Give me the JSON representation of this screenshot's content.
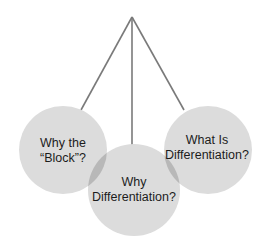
{
  "diagram": {
    "apex": {
      "x": 132,
      "y": 17
    },
    "colors": {
      "circle_fill": "#dcdcdc",
      "overlap_fill": "#b8b8b8",
      "line": "#7a7a7a",
      "text": "#1c1c1c",
      "background": "#ffffff"
    },
    "nodes": [
      {
        "id": "left",
        "line1": "Why the",
        "line2": "“Block”?",
        "cx": 63,
        "cy": 150,
        "r": 44
      },
      {
        "id": "middle",
        "line1": "Why",
        "line2": "Differentiation?",
        "cx": 134,
        "cy": 190,
        "r": 46
      },
      {
        "id": "right",
        "line1": "What Is",
        "line2": "Differentiation?",
        "cx": 208,
        "cy": 150,
        "r": 44
      }
    ]
  }
}
